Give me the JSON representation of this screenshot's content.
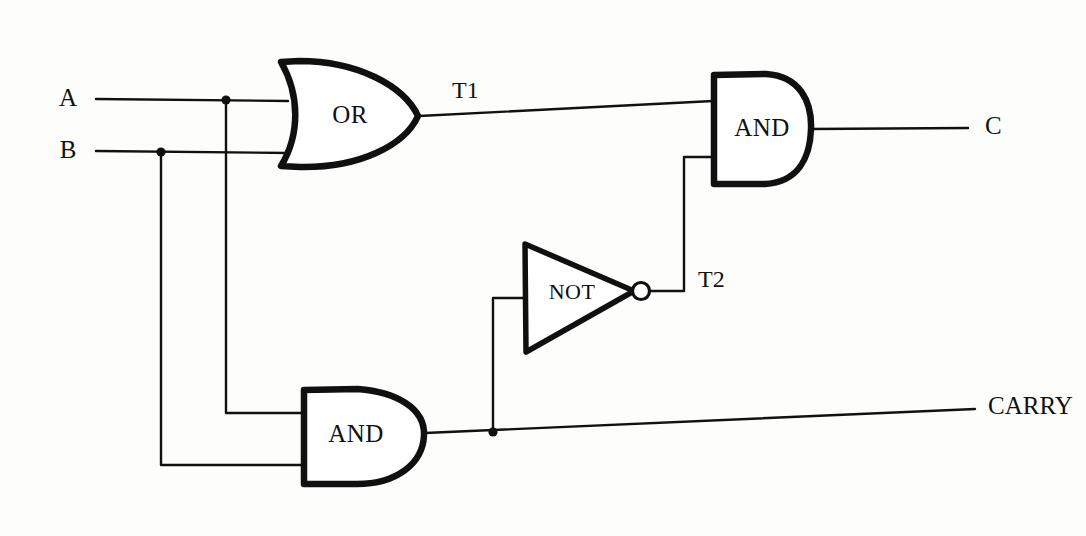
{
  "diagram": {
    "background_color": "#fdfdfb",
    "ink_color": "#111111",
    "inputs": [
      {
        "id": "A",
        "label": "A",
        "x": 68,
        "y": 100
      },
      {
        "id": "B",
        "label": "B",
        "x": 68,
        "y": 152
      }
    ],
    "outputs": [
      {
        "id": "C",
        "label": "C",
        "x": 985,
        "y": 128
      },
      {
        "id": "CARRY",
        "label": "CARRY",
        "x": 988,
        "y": 408
      }
    ],
    "intermediate_labels": [
      {
        "id": "T1",
        "label": "T1",
        "x": 452,
        "y": 92
      },
      {
        "id": "T2",
        "label": "T2",
        "x": 698,
        "y": 281
      }
    ],
    "gates": [
      {
        "id": "or1",
        "type": "OR",
        "label": "OR",
        "label_x": 350,
        "label_y": 117,
        "inputs": [
          "A",
          "B"
        ],
        "output": "T1"
      },
      {
        "id": "and1",
        "type": "AND",
        "label": "AND",
        "label_x": 762,
        "label_y": 130,
        "inputs": [
          "T1",
          "T2"
        ],
        "output": "C"
      },
      {
        "id": "not1",
        "type": "NOT",
        "label": "NOT",
        "label_x": 572,
        "label_y": 294,
        "inputs": [
          "CARRY"
        ],
        "output": "T2"
      },
      {
        "id": "and2",
        "type": "AND",
        "label": "AND",
        "label_x": 356,
        "label_y": 436,
        "inputs": [
          "A",
          "B"
        ],
        "output": "CARRY"
      }
    ],
    "junctions": [
      {
        "id": "j-a",
        "on": "A",
        "x": 226,
        "y": 100
      },
      {
        "id": "j-b",
        "on": "B",
        "x": 161,
        "y": 152
      },
      {
        "id": "j-carry",
        "on": "CARRY",
        "x": 493,
        "y": 432
      }
    ],
    "equations": {
      "sum": "C = (A OR B) AND NOT(A AND B)",
      "carry": "CARRY = A AND B"
    }
  }
}
